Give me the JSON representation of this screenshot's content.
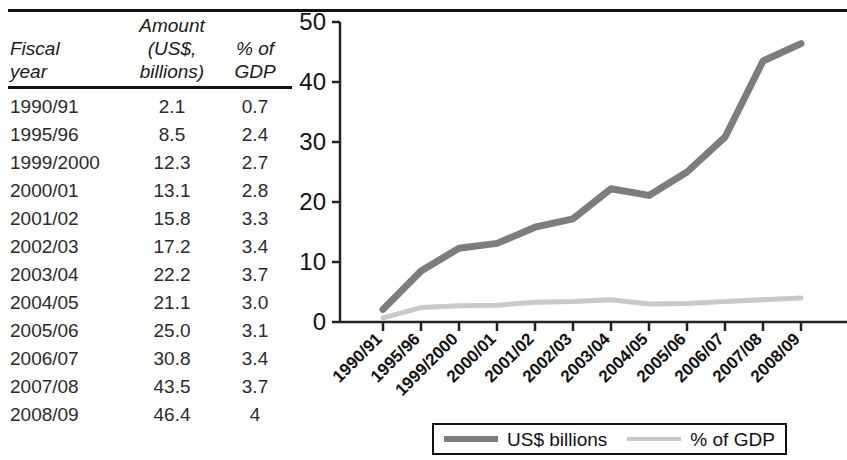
{
  "table": {
    "headers": {
      "fiscal_year": "Fiscal\nyear",
      "fiscal_year_line1": "Fiscal",
      "fiscal_year_line2": "year",
      "amount_line1": "Amount",
      "amount_line2": "(US$,",
      "amount_line3": "billions)",
      "pct_line1": "% of",
      "pct_line2": "GDP"
    },
    "rows": [
      {
        "year": "1990/91",
        "amount": "2.1",
        "pct": "0.7"
      },
      {
        "year": "1995/96",
        "amount": "8.5",
        "pct": "2.4"
      },
      {
        "year": "1999/2000",
        "amount": "12.3",
        "pct": "2.7"
      },
      {
        "year": "2000/01",
        "amount": "13.1",
        "pct": "2.8"
      },
      {
        "year": "2001/02",
        "amount": "15.8",
        "pct": "3.3"
      },
      {
        "year": "2002/03",
        "amount": "17.2",
        "pct": "3.4"
      },
      {
        "year": "2003/04",
        "amount": "22.2",
        "pct": "3.7"
      },
      {
        "year": "2004/05",
        "amount": "21.1",
        "pct": "3.0"
      },
      {
        "year": "2005/06",
        "amount": "25.0",
        "pct": "3.1"
      },
      {
        "year": "2006/07",
        "amount": "30.8",
        "pct": "3.4"
      },
      {
        "year": "2007/08",
        "amount": "43.5",
        "pct": "3.7"
      },
      {
        "year": "2008/09",
        "amount": "46.4",
        "pct": "4"
      }
    ]
  },
  "legend": {
    "entries": [
      {
        "label": "US$ billions",
        "color": "#7d7d7d",
        "weight": "thick"
      },
      {
        "label": "% of GDP",
        "color": "#c9c9c9",
        "weight": "thin"
      }
    ]
  },
  "chart_data": {
    "type": "line",
    "title": "",
    "xlabel": "",
    "ylabel": "",
    "ylim": [
      0,
      50
    ],
    "yticks": [
      0,
      10,
      20,
      30,
      40,
      50
    ],
    "ytick_labels": [
      "0",
      "10",
      "20",
      "30",
      "40",
      "50"
    ],
    "grid": false,
    "legend_position": "bottom",
    "x_tick_rotation": -45,
    "categories": [
      "1990/91",
      "1995/96",
      "1999/2000",
      "2000/01",
      "2001/02",
      "2002/03",
      "2003/04",
      "2004/05",
      "2005/06",
      "2006/07",
      "2007/08",
      "2008/09"
    ],
    "series": [
      {
        "name": "US$ billions",
        "color": "#7d7d7d",
        "width": 7,
        "values": [
          2.1,
          8.5,
          12.3,
          13.1,
          15.8,
          17.2,
          22.2,
          21.1,
          25.0,
          30.8,
          43.5,
          46.4
        ]
      },
      {
        "name": "% of GDP",
        "color": "#c9c9c9",
        "width": 5,
        "values": [
          0.7,
          2.4,
          2.7,
          2.8,
          3.3,
          3.4,
          3.7,
          3.0,
          3.1,
          3.4,
          3.7,
          4.0
        ]
      }
    ]
  },
  "colors": {
    "rule": "#111111",
    "axis": "#222222",
    "series_primary": "#7d7d7d",
    "series_secondary": "#c9c9c9",
    "text": "#1a1a1a"
  }
}
